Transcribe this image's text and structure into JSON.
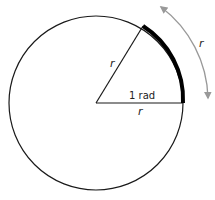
{
  "diagram": {
    "labels": {
      "radius_upper": "r",
      "radius_lower": "r",
      "angle": "1 rad",
      "arc_length": "r"
    },
    "colors": {
      "circle": "#1a1a1a",
      "arc": "#000000",
      "arrow": "#999999",
      "background": "#ffffff"
    }
  }
}
